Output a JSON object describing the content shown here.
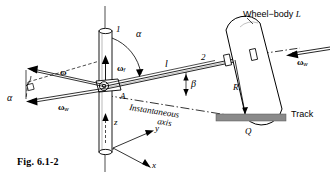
{
  "figure": {
    "caption": "Fig. 6.1-2",
    "title_label": "Wheel−body",
    "title_body_symbol": "L",
    "track_label": "Track",
    "contact_point": "Q",
    "radius_label": "R",
    "length_label": "l",
    "point_A": "A",
    "joint_1": "1",
    "joint_2": "2",
    "axis_z": "z",
    "axis_y": "y",
    "axis_x": "x",
    "angle_alpha_top": "α",
    "angle_alpha_left": "α",
    "angle_beta": "β",
    "omega_resultant": "ω",
    "omega_frame": "ω",
    "omega_frame_sub": "f",
    "omega_wheel_left": "ω",
    "omega_wheel_left_sub": "w",
    "omega_wheel_right": "ω",
    "omega_wheel_right_sub": "w",
    "instantaneous_line1": "Instantaneous",
    "instantaneous_line2": "axis"
  },
  "colors": {
    "ink": "#000000",
    "track_fill": "#8a8a8a",
    "paper": "#ffffff",
    "body_fill": "#ffffff"
  }
}
